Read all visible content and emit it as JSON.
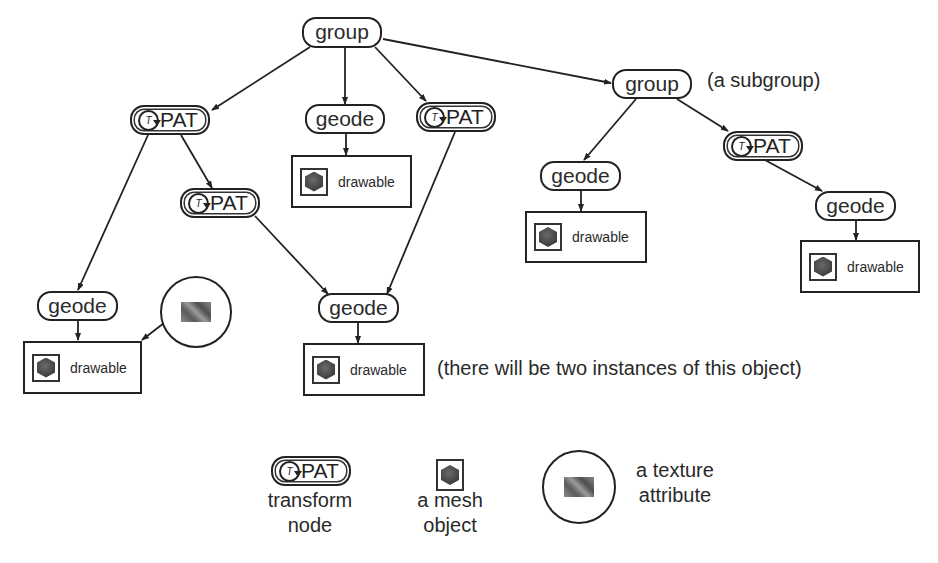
{
  "diagram": {
    "nodes": {
      "root_group": {
        "type": "group",
        "label": "group"
      },
      "pat_left": {
        "type": "transform",
        "icon_letter": "T",
        "label": "PAT"
      },
      "geode_center": {
        "type": "geode",
        "label": "geode"
      },
      "drawable_center": {
        "type": "drawable",
        "label": "drawable"
      },
      "pat_center_right": {
        "type": "transform",
        "icon_letter": "T",
        "label": "PAT"
      },
      "pat_mid": {
        "type": "transform",
        "icon_letter": "T",
        "label": "PAT"
      },
      "subgroup": {
        "type": "group",
        "label": "group"
      },
      "subgroup_geode": {
        "type": "geode",
        "label": "geode"
      },
      "subgroup_drawable": {
        "type": "drawable",
        "label": "drawable"
      },
      "subgroup_pat": {
        "type": "transform",
        "icon_letter": "T",
        "label": "PAT"
      },
      "subgroup_pat_geode": {
        "type": "geode",
        "label": "geode"
      },
      "subgroup_pat_drawable": {
        "type": "drawable",
        "label": "drawable"
      },
      "geode_left": {
        "type": "geode",
        "label": "geode"
      },
      "drawable_left": {
        "type": "drawable",
        "label": "drawable"
      },
      "texture": {
        "type": "texture-attribute"
      },
      "shared_geode": {
        "type": "geode",
        "label": "geode"
      },
      "shared_drawable": {
        "type": "drawable",
        "label": "drawable"
      }
    },
    "edges": [
      [
        "root_group",
        "pat_left"
      ],
      [
        "root_group",
        "geode_center"
      ],
      [
        "root_group",
        "pat_center_right"
      ],
      [
        "root_group",
        "subgroup"
      ],
      [
        "geode_center",
        "drawable_center"
      ],
      [
        "pat_left",
        "geode_left"
      ],
      [
        "pat_left",
        "pat_mid"
      ],
      [
        "pat_mid",
        "shared_geode"
      ],
      [
        "pat_center_right",
        "shared_geode"
      ],
      [
        "geode_left",
        "drawable_left"
      ],
      [
        "texture",
        "drawable_left"
      ],
      [
        "shared_geode",
        "shared_drawable"
      ],
      [
        "subgroup",
        "subgroup_geode"
      ],
      [
        "subgroup",
        "subgroup_pat"
      ],
      [
        "subgroup_geode",
        "subgroup_drawable"
      ],
      [
        "subgroup_pat",
        "subgroup_pat_geode"
      ],
      [
        "subgroup_pat_geode",
        "subgroup_pat_drawable"
      ]
    ],
    "annotations": {
      "subgroup_note": "(a subgroup)",
      "instances_note": "(there will be two instances of this object)"
    }
  },
  "legend": {
    "transform": {
      "icon_letter": "T",
      "label": "PAT",
      "caption_line1": "transform",
      "caption_line2": "node"
    },
    "mesh": {
      "caption_line1": "a mesh",
      "caption_line2": "object"
    },
    "texture": {
      "caption_line1": "a texture",
      "caption_line2": "attribute"
    }
  }
}
